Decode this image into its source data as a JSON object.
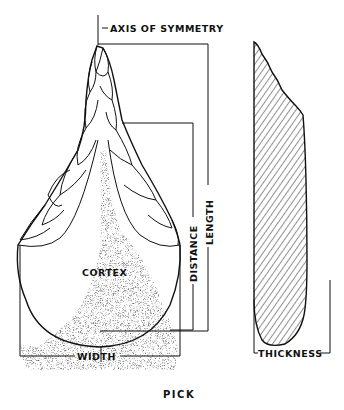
{
  "figure": {
    "caption": "PICK",
    "labels": {
      "axis": "AXIS OF SYMMETRY",
      "cortex": "CORTEX",
      "distance": "DISTANCE",
      "length": "LENGTH",
      "width": "WIDTH",
      "thickness": "THICKNESS"
    },
    "views": [
      {
        "name": "face view",
        "feature": "flake scars with cortex (stippled) at butt"
      },
      {
        "name": "side profile",
        "feature": "hatched cross-section"
      }
    ],
    "colors": {
      "ink": "#111111",
      "background": "#ffffff"
    }
  }
}
